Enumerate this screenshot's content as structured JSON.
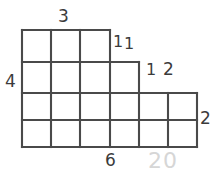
{
  "figure": {
    "name": "staircase-grid-diagram",
    "stroke_color": "#4a4a4a",
    "faint_color": "#d6d6d6",
    "background_color": "#ffffff",
    "cell_size": 29,
    "origin": {
      "x": 22,
      "y": 30
    },
    "rows": [
      {
        "index": 1,
        "columns": 3
      },
      {
        "index": 2,
        "columns": 4
      },
      {
        "index": 3,
        "columns": 6
      },
      {
        "index": 4,
        "columns": 6
      }
    ]
  },
  "labels": {
    "top_width": "3",
    "left_height": "4",
    "bottom_width": "6",
    "right_height": "2",
    "step_a_first": "1",
    "step_a_second": "1",
    "step_b_first": "1",
    "step_b_second": "2",
    "faint_total": "20"
  }
}
